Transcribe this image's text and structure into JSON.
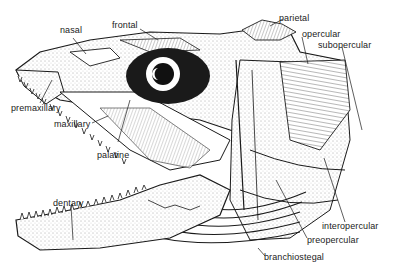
{
  "diagram": {
    "labels": {
      "nasal": "nasal",
      "frontal": "frontal",
      "parietal": "parietal",
      "opercular": "opercular",
      "subopercular": "subopercular",
      "premaxillary": "premaxillary",
      "maxillary": "maxillary",
      "palatine": "palatine",
      "dentary": "dentary",
      "interopercular": "interopercular",
      "preopercular": "preopercular",
      "branchiostegal": "branchiostegal"
    },
    "colors": {
      "ink": "#1a1a1a",
      "background": "#ffffff",
      "stipple": "#555555"
    }
  }
}
